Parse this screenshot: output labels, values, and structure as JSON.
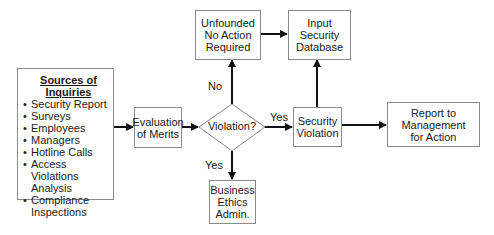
{
  "diagram": {
    "sources": {
      "title": "Sources of Inquiries",
      "items": [
        "Security Report",
        "Surveys",
        "Employees",
        "Managers",
        "Hotline Calls",
        "Access Violations Analysis",
        "Compliance Inspections"
      ]
    },
    "evaluation": {
      "lines": [
        "Evaluation",
        "of Merits"
      ]
    },
    "decision": {
      "label": "Violation?"
    },
    "unfounded": {
      "lines": [
        "Unfounded",
        "No Action",
        "Required"
      ]
    },
    "input_db": {
      "lines": [
        "Input",
        "Security",
        "Database"
      ]
    },
    "security_violation": {
      "lines": [
        "Security",
        "Violation"
      ]
    },
    "report": {
      "lines": [
        "Report to",
        "Management",
        "for Action"
      ]
    },
    "business_ethics": {
      "lines": [
        "Business",
        "Ethics",
        "Admin."
      ]
    },
    "edge_labels": {
      "no": "No",
      "yes_right": "Yes",
      "yes_down": "Yes"
    },
    "colors": {
      "line": "#111111",
      "border": "#8a8a8a",
      "background": "#ffffff"
    }
  }
}
